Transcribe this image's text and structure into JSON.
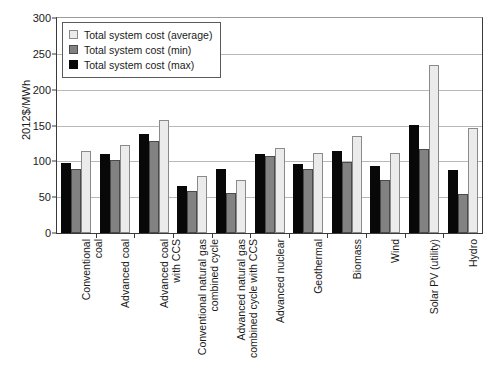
{
  "chart_data": {
    "type": "bar",
    "title": "",
    "xlabel": "",
    "ylabel": "2012$/MWh",
    "ylim": [
      0,
      300
    ],
    "ytick_step": 50,
    "yticks": [
      0,
      50,
      100,
      150,
      200,
      250,
      300
    ],
    "ytick_labels": [
      "0",
      "50",
      "100",
      "150",
      "200",
      "250",
      "300"
    ],
    "grid": true,
    "legend_position": "upper-left-inside",
    "categories": [
      "Conventional\ncoal",
      "Advanced coal",
      "Advanced coal\nwith CCS",
      "Conventional natural gas\ncombined cycle",
      "Advanced natural gas\ncombined cycle with CCS",
      "Advanced nuclear",
      "Geothermal",
      "Biomass",
      "Wind",
      "Solar PV (utility)",
      "Hydro"
    ],
    "series": [
      {
        "name": "Total system cost (max)",
        "color": "#080808",
        "values": [
          97,
          110,
          138,
          65,
          89,
          110,
          96,
          115,
          94,
          151,
          88
        ]
      },
      {
        "name": "Total system cost (min)",
        "color": "#828282",
        "values": [
          90,
          102,
          128,
          59,
          56,
          108,
          89,
          99,
          74,
          117,
          55
        ]
      },
      {
        "name": "Total system cost (average)",
        "color": "#ebebeb",
        "values": [
          114,
          123,
          157,
          80,
          74,
          118,
          112,
          135,
          111,
          235,
          147
        ]
      }
    ]
  },
  "legend": {
    "items": [
      {
        "label": "Total system cost (average)",
        "swatch": "avg"
      },
      {
        "label": "Total system cost (min)",
        "swatch": "min"
      },
      {
        "label": "Total system cost (max)",
        "swatch": "max"
      }
    ]
  }
}
